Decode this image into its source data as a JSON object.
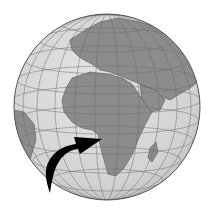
{
  "image": {
    "subject": "globe",
    "description": "Grayscale globe centered on Africa and Europe with a black curved arrow pointing to West-Central Africa",
    "colors": {
      "background": "#ffffff",
      "ocean": "#d6d6d6",
      "land": "#8c8c8c",
      "grid": "#6e6e6e",
      "outline": "#555555",
      "arrow": "#000000"
    },
    "elements": [
      "globe-sphere",
      "graticule",
      "continents",
      "pointer-arrow"
    ]
  }
}
